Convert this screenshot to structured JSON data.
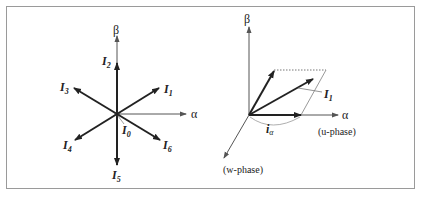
{
  "left_diagram": {
    "title": "Six active voltage vectors in alpha-beta plane",
    "axes": {
      "alpha": "α",
      "beta": "β"
    },
    "vectors": [
      {
        "name": "I",
        "sub": "1",
        "angle_deg": 30
      },
      {
        "name": "I",
        "sub": "2",
        "angle_deg": 90
      },
      {
        "name": "I",
        "sub": "3",
        "angle_deg": 150
      },
      {
        "name": "I",
        "sub": "4",
        "angle_deg": 210
      },
      {
        "name": "I",
        "sub": "5",
        "angle_deg": 270
      },
      {
        "name": "I",
        "sub": "6",
        "angle_deg": 330
      }
    ],
    "zero_vector": {
      "name": "I",
      "sub": "0"
    }
  },
  "right_diagram": {
    "axes": {
      "alpha": "α",
      "beta": "β"
    },
    "vector": {
      "name": "I",
      "sub": "1"
    },
    "component": {
      "name": "i",
      "sub": "α"
    },
    "phase_labels": {
      "u": "(u-phase)",
      "w": "(w-phase)"
    }
  },
  "colors": {
    "frame": "#9a9a9a",
    "axis": "#555555",
    "vector": "#222222",
    "guide": "#999999"
  }
}
